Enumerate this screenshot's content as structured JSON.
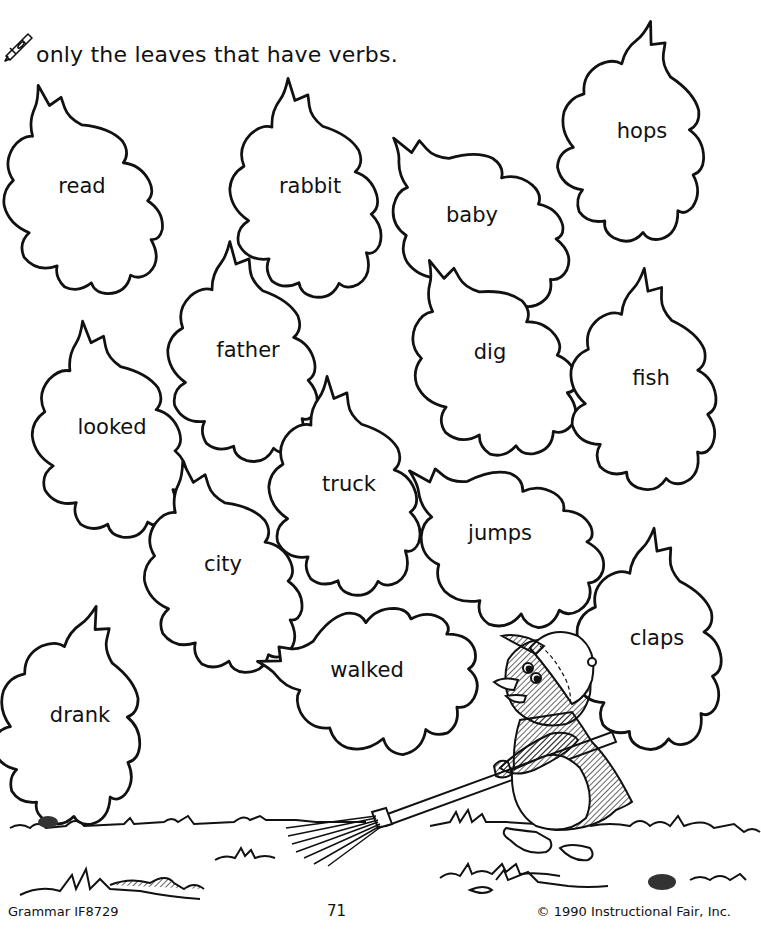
{
  "instruction": {
    "icon": "crayon-icon",
    "text": "only the leaves that have verbs."
  },
  "leaves": [
    {
      "word": "read",
      "x": 82,
      "y": 186
    },
    {
      "word": "rabbit",
      "x": 310,
      "y": 186
    },
    {
      "word": "baby",
      "x": 472,
      "y": 215
    },
    {
      "word": "hops",
      "x": 642,
      "y": 131
    },
    {
      "word": "father",
      "x": 248,
      "y": 350
    },
    {
      "word": "dig",
      "x": 490,
      "y": 352
    },
    {
      "word": "fish",
      "x": 651,
      "y": 378
    },
    {
      "word": "looked",
      "x": 112,
      "y": 427
    },
    {
      "word": "truck",
      "x": 349,
      "y": 484
    },
    {
      "word": "jumps",
      "x": 500,
      "y": 533
    },
    {
      "word": "city",
      "x": 223,
      "y": 564
    },
    {
      "word": "claps",
      "x": 657,
      "y": 638
    },
    {
      "word": "walked",
      "x": 367,
      "y": 670
    },
    {
      "word": "drank",
      "x": 80,
      "y": 715
    }
  ],
  "illustration": {
    "subject": "penguin-raking-leaves",
    "elements": [
      "penguin",
      "cap",
      "rake",
      "grass",
      "rocks"
    ]
  },
  "footer": {
    "left": "Grammar IF8729",
    "page_number": "71",
    "copyright": "© 1990 Instructional Fair, Inc."
  }
}
